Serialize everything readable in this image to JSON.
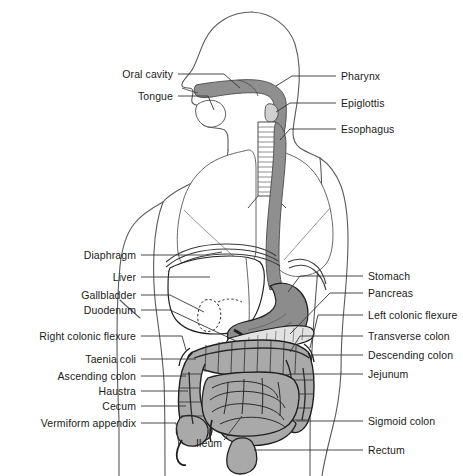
{
  "figure": {
    "colors": {
      "outline": "#4d4d4d",
      "organ_stroke": "#1a1a1a",
      "intestine_fill": "#a9a9a9",
      "stomach_fill": "#8c8c8c",
      "esophagus_fill": "#8f8f8f",
      "liver_fill": "#ffffff",
      "pancreas_fill": "#d9d9d9",
      "leader_line": "#333333",
      "label_text": "#1a1a1a",
      "background": "#ffffff"
    }
  },
  "labels_left": [
    {
      "id": "oral-cavity",
      "text": "Oral cavity",
      "x": 173,
      "y": 74
    },
    {
      "id": "tongue",
      "text": "Tongue",
      "x": 173,
      "y": 96
    },
    {
      "id": "diaphragm",
      "text": "Diaphragm",
      "x": 136,
      "y": 255
    },
    {
      "id": "liver",
      "text": "Liver",
      "x": 136,
      "y": 277
    },
    {
      "id": "gallbladder",
      "text": "Gallbladder",
      "x": 136,
      "y": 295
    },
    {
      "id": "duodenum",
      "text": "Duodenum",
      "x": 136,
      "y": 310
    },
    {
      "id": "right-colonic-flexure",
      "text": "Right colonic flexure",
      "x": 136,
      "y": 336
    },
    {
      "id": "taenia-coli",
      "text": "Taenia coli",
      "x": 136,
      "y": 359
    },
    {
      "id": "ascending-colon",
      "text": "Ascending colon",
      "x": 136,
      "y": 376
    },
    {
      "id": "haustra",
      "text": "Haustra",
      "x": 136,
      "y": 391
    },
    {
      "id": "cecum",
      "text": "Cecum",
      "x": 136,
      "y": 406
    },
    {
      "id": "vermiform-appendix",
      "text": "Vermiform appendix",
      "x": 136,
      "y": 423
    }
  ],
  "labels_right": [
    {
      "id": "pharynx",
      "text": "Pharynx",
      "x": 341,
      "y": 76
    },
    {
      "id": "epiglottis",
      "text": "Epiglottis",
      "x": 341,
      "y": 103
    },
    {
      "id": "esophagus",
      "text": "Esophagus",
      "x": 341,
      "y": 129
    },
    {
      "id": "stomach",
      "text": "Stomach",
      "x": 368,
      "y": 276
    },
    {
      "id": "pancreas",
      "text": "Pancreas",
      "x": 368,
      "y": 293
    },
    {
      "id": "left-colonic-flexure",
      "text": "Left colonic flexure",
      "x": 368,
      "y": 315
    },
    {
      "id": "transverse-colon",
      "text": "Transverse colon",
      "x": 368,
      "y": 336
    },
    {
      "id": "descending-colon",
      "text": "Descending colon",
      "x": 368,
      "y": 355
    },
    {
      "id": "jejunum",
      "text": "Jejunum",
      "x": 368,
      "y": 374
    },
    {
      "id": "sigmoid-colon",
      "text": "Sigmoid colon",
      "x": 368,
      "y": 421
    },
    {
      "id": "rectum",
      "text": "Rectum",
      "x": 368,
      "y": 450
    }
  ],
  "labels_free": [
    {
      "id": "ileum",
      "text": "Ileum",
      "x": 196,
      "y": 443
    }
  ]
}
